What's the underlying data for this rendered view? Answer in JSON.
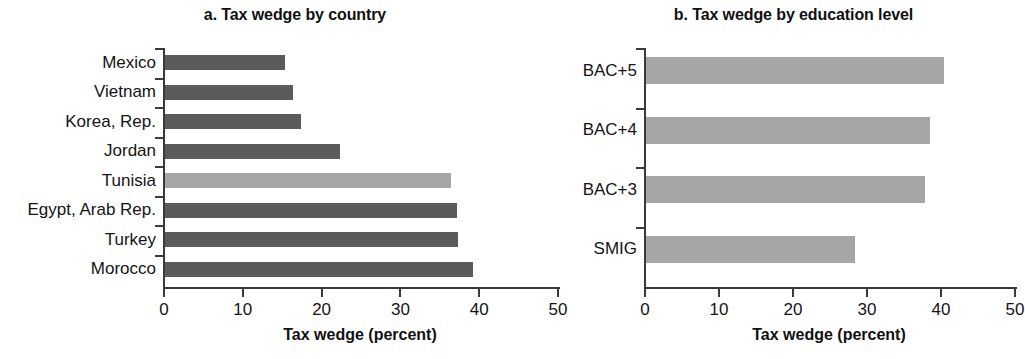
{
  "figure": {
    "panel_a_title": "a. Tax wedge by country",
    "panel_b_title": "b. Tax wedge by education level"
  },
  "chart_data": [
    {
      "type": "bar",
      "orientation": "horizontal",
      "title": "a. Tax wedge by country",
      "xlabel": "Tax wedge (percent)",
      "ylabel": "",
      "xlim": [
        0,
        50
      ],
      "xticks": [
        0,
        10,
        20,
        30,
        40,
        50
      ],
      "xtick_labels": [
        "0",
        "10",
        "20",
        "30",
        "40",
        "50"
      ],
      "grid": false,
      "legend": false,
      "categories": [
        "Mexico",
        "Vietnam",
        "Korea, Rep.",
        "Jordan",
        "Tunisia",
        "Egypt, Arab Rep.",
        "Turkey",
        "Morocco"
      ],
      "values": [
        15.2,
        16.2,
        17.3,
        22.2,
        36.3,
        37.0,
        37.2,
        39.1
      ],
      "bar_colors": [
        "#5b5b5b",
        "#5b5b5b",
        "#5b5b5b",
        "#5b5b5b",
        "#a6a6a6",
        "#5b5b5b",
        "#5b5b5b",
        "#5b5b5b"
      ]
    },
    {
      "type": "bar",
      "orientation": "horizontal",
      "title": "b. Tax wedge by education level",
      "xlabel": "Tax wedge (percent)",
      "ylabel": "",
      "xlim": [
        0,
        50
      ],
      "xticks": [
        0,
        10,
        20,
        30,
        40,
        50
      ],
      "xtick_labels": [
        "0",
        "10",
        "20",
        "30",
        "40",
        "50"
      ],
      "grid": false,
      "legend": false,
      "categories": [
        "BAC+5",
        "BAC+4",
        "BAC+3",
        "SMIG"
      ],
      "values": [
        40.3,
        38.4,
        37.7,
        28.2
      ],
      "bar_colors": [
        "#a6a6a6",
        "#a6a6a6",
        "#a6a6a6",
        "#a6a6a6"
      ]
    }
  ],
  "panel_a": {
    "title": "a. Tax wedge by country",
    "axis_title": "Tax wedge (percent)",
    "categories": [
      {
        "label": "Mexico",
        "value": 15.2
      },
      {
        "label": "Vietnam",
        "value": 16.2
      },
      {
        "label": "Korea, Rep.",
        "value": 17.3
      },
      {
        "label": "Jordan",
        "value": 22.2
      },
      {
        "label": "Tunisia",
        "value": 36.3
      },
      {
        "label": "Egypt, Arab Rep.",
        "value": 37.0
      },
      {
        "label": "Turkey",
        "value": 37.2
      },
      {
        "label": "Morocco",
        "value": 39.1
      }
    ],
    "xticks": [
      "0",
      "10",
      "20",
      "30",
      "40",
      "50"
    ]
  },
  "panel_b": {
    "title": "b. Tax wedge by education level",
    "axis_title": "Tax wedge (percent)",
    "categories": [
      {
        "label": "BAC+5",
        "value": 40.3
      },
      {
        "label": "BAC+4",
        "value": 38.4
      },
      {
        "label": "BAC+3",
        "value": 37.7
      },
      {
        "label": "SMIG",
        "value": 28.2
      }
    ],
    "xticks": [
      "0",
      "10",
      "20",
      "30",
      "40",
      "50"
    ]
  }
}
